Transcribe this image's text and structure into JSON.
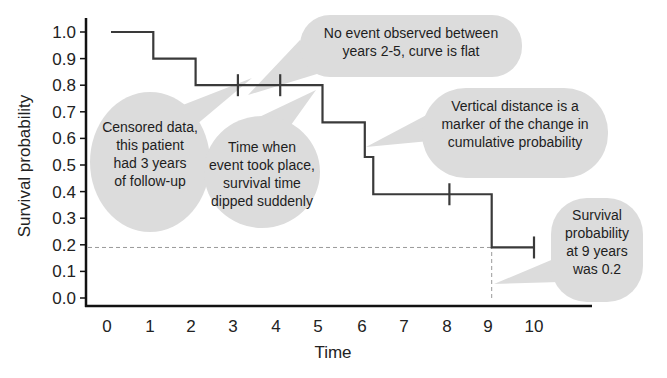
{
  "chart_data": {
    "type": "line",
    "subtype": "kaplan-meier-step",
    "title": "",
    "xlabel": "Time",
    "ylabel": "Survival probability",
    "xlim": [
      0,
      10
    ],
    "ylim": [
      0.0,
      1.0
    ],
    "x_ticks": [
      "0",
      "1",
      "2",
      "3",
      "4",
      "5",
      "6",
      "7",
      "8",
      "9",
      "10"
    ],
    "y_ticks": [
      "0.0",
      "0.1",
      "0.2",
      "0.3",
      "0.4",
      "0.5",
      "0.6",
      "0.7",
      "0.8",
      "0.9",
      "1.0"
    ],
    "grid": false,
    "legend": null,
    "series": [
      {
        "name": "Survival curve",
        "steps": [
          {
            "x_start": 0,
            "x_end": 1,
            "y": 1.0
          },
          {
            "x_start": 1,
            "x_end": 2,
            "y": 0.9
          },
          {
            "x_start": 2,
            "x_end": 5,
            "y": 0.8
          },
          {
            "x_start": 5,
            "x_end": 6,
            "y": 0.66
          },
          {
            "x_start": 6,
            "x_end": 6.2,
            "y": 0.53
          },
          {
            "x_start": 6.2,
            "x_end": 9,
            "y": 0.39
          },
          {
            "x_start": 9,
            "x_end": 10,
            "y": 0.19
          }
        ],
        "censored": [
          {
            "x": 3,
            "y": 0.8
          },
          {
            "x": 4,
            "y": 0.8
          },
          {
            "x": 8,
            "y": 0.39
          },
          {
            "x": 10,
            "y": 0.19
          }
        ]
      }
    ],
    "reference_lines": [
      {
        "type": "horizontal",
        "y": 0.19,
        "style": "dashed",
        "from_x": 0,
        "to_x": 9
      },
      {
        "type": "vertical",
        "x": 9,
        "style": "dashed",
        "from_y": 0,
        "to_y": 0.19
      }
    ],
    "annotations": [
      {
        "id": "censored",
        "lines": [
          "Censored data,",
          "this patient",
          "had 3 years",
          "of follow-up"
        ],
        "points_to": {
          "x": 3,
          "y": 0.8
        }
      },
      {
        "id": "no-event",
        "lines": [
          "No event observed between",
          "years 2-5, curve is flat"
        ],
        "points_to": {
          "x": 3.5,
          "y": 0.8
        }
      },
      {
        "id": "event-time",
        "lines": [
          "Time when",
          "event took place,",
          "survival time",
          "dipped suddenly"
        ],
        "points_to": {
          "x": 5,
          "y": 0.8
        }
      },
      {
        "id": "vertical-distance",
        "lines": [
          "Vertical distance is a",
          "marker of the change in",
          "cumulative probability"
        ],
        "points_to": {
          "x": 6,
          "y": 0.6
        }
      },
      {
        "id": "survival-9",
        "lines": [
          "Survival",
          "probability",
          "at 9 years",
          "was 0.2"
        ],
        "points_to": {
          "x": 9,
          "y": 0.1
        }
      }
    ]
  },
  "axes": {
    "x_title": "Time",
    "y_title": "Survival probability"
  },
  "colors": {
    "curve": "#3a3a3a",
    "axis": "#111111",
    "bubble": "#dcdcdc",
    "dashed": "#999999"
  }
}
